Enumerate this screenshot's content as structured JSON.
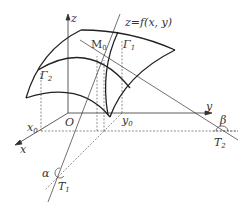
{
  "diagram": {
    "labels": {
      "z_axis": "z",
      "y_axis": "y",
      "x_axis": "x",
      "origin": "O",
      "surface": "z=f(x, y)",
      "point_M0": "M",
      "point_M0_sub": "0",
      "curve_1": "Γ",
      "curve_1_sub": "1",
      "curve_2": "Γ",
      "curve_2_sub": "2",
      "x0": "x",
      "x0_sub": "0",
      "y0": "y",
      "y0_sub": "0",
      "tangent_1": "T",
      "tangent_1_sub": "1",
      "tangent_2": "T",
      "tangent_2_sub": "2",
      "angle_alpha": "α",
      "angle_beta": "β"
    },
    "colors": {
      "stroke": "#333333",
      "background": "#ffffff"
    }
  }
}
